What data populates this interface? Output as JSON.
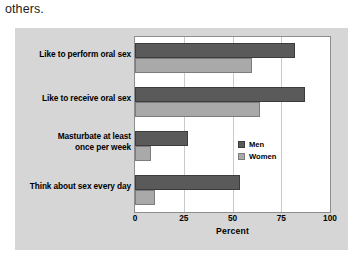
{
  "page": {
    "text_fragment": "others."
  },
  "chart_data": {
    "type": "bar",
    "orientation": "horizontal",
    "title": "",
    "subtitle": "",
    "xlabel": "Percent",
    "ylabel": "",
    "xlim": [
      0,
      100
    ],
    "xticks": [
      0,
      25,
      50,
      75,
      100
    ],
    "xtick_labels": [
      "0",
      "25",
      "50",
      "75",
      "100"
    ],
    "grid": true,
    "grid_axis": "x",
    "legend_position": "inside-right",
    "categories": [
      "Like to perform oral sex",
      "Like to receive oral sex",
      "Masturbate at least\nonce per week",
      "Think about sex every day"
    ],
    "category_labels": [
      "Like to perform oral sex",
      "Like to receive oral sex",
      "Masturbate at least once per week",
      "Think about sex every day"
    ],
    "series": [
      {
        "name": "Men",
        "color": "#5a5a5a",
        "values": [
          82,
          87,
          27,
          54
        ]
      },
      {
        "name": "Women",
        "color": "#a9a9a9",
        "values": [
          60,
          64,
          8,
          10
        ]
      }
    ],
    "colors": {
      "men": "#5a5a5a",
      "women": "#a9a9a9",
      "plot_background": "#ffffff",
      "figure_background": "#d6d6d6",
      "gridline": "#c9c9c9",
      "axis_border": "#8d8d8d"
    }
  }
}
